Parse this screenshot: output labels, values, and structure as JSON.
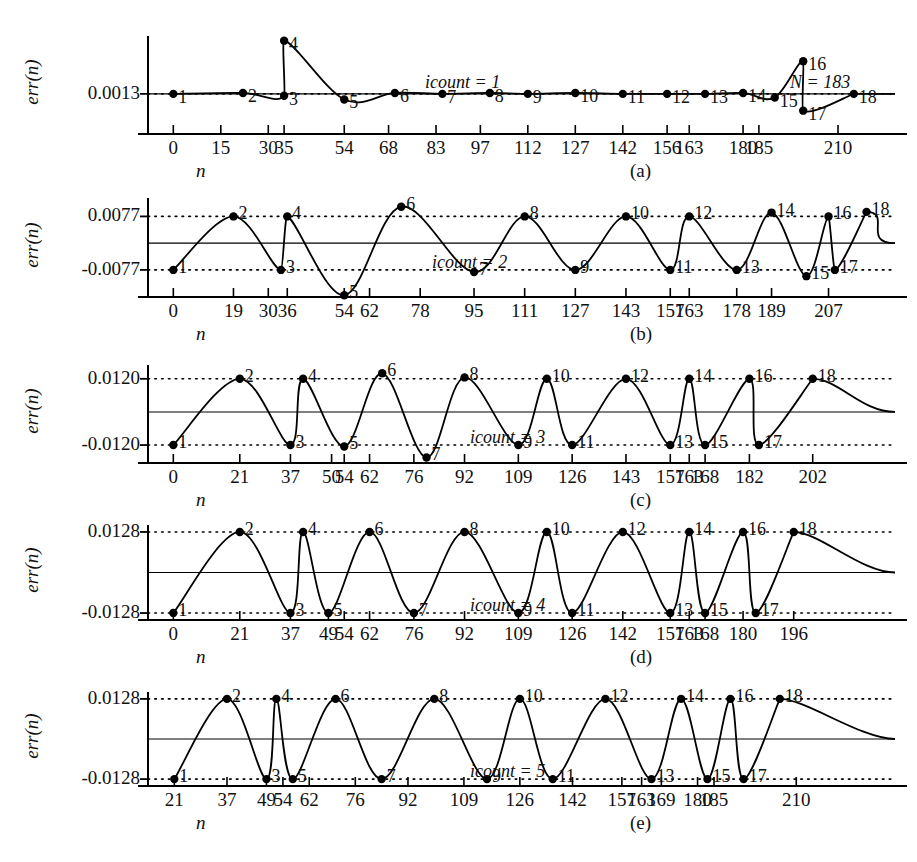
{
  "figure": {
    "ylabel": "err(n)",
    "xlabel": "n"
  },
  "chart_data": [
    {
      "type": "line",
      "panel": "(a)",
      "title": "",
      "xlabel": "n",
      "ylabel": "err(n)",
      "annotation": "icount = 1",
      "annotation2": "N = 183",
      "ytick_labels": [
        "0.0013"
      ],
      "ylim": [
        -0.003,
        0.0075
      ],
      "yticks": [
        0.0013
      ],
      "grid": "dotted at 0.0013",
      "xlim": [
        -8,
        228
      ],
      "xtick_labels": [
        "0",
        "15",
        "30",
        "35",
        "54",
        "68",
        "83",
        "97",
        "112",
        "127",
        "142",
        "156",
        "163",
        "180",
        "185",
        "210"
      ],
      "xticks": [
        0,
        15,
        30,
        35,
        54,
        68,
        83,
        97,
        112,
        127,
        142,
        156,
        163,
        180,
        185,
        210
      ],
      "points": [
        {
          "label": "1",
          "x": 0,
          "y": 0.0013
        },
        {
          "label": "2",
          "x": 22,
          "y": 0.0014
        },
        {
          "label": "3",
          "x": 35,
          "y": 0.0011
        },
        {
          "label": "4",
          "x": 35,
          "y": 0.007
        },
        {
          "label": "5",
          "x": 54,
          "y": 0.0007
        },
        {
          "label": "6",
          "x": 70,
          "y": 0.0014
        },
        {
          "label": "7",
          "x": 85,
          "y": 0.0013
        },
        {
          "label": "8",
          "x": 100,
          "y": 0.0014
        },
        {
          "label": "9",
          "x": 112,
          "y": 0.0013
        },
        {
          "label": "10",
          "x": 127,
          "y": 0.0014
        },
        {
          "label": "11",
          "x": 142,
          "y": 0.0013
        },
        {
          "label": "12",
          "x": 156,
          "y": 0.0013
        },
        {
          "label": "13",
          "x": 168,
          "y": 0.0013
        },
        {
          "label": "14",
          "x": 180,
          "y": 0.0014
        },
        {
          "label": "15",
          "x": 190,
          "y": 0.0009
        },
        {
          "label": "16",
          "x": 199,
          "y": 0.0048
        },
        {
          "label": "17",
          "x": 199,
          "y": -0.0005
        },
        {
          "label": "18",
          "x": 215,
          "y": 0.0013
        }
      ]
    },
    {
      "type": "line",
      "panel": "(b)",
      "title": "",
      "xlabel": "n",
      "ylabel": "err(n)",
      "annotation": "icount = 2",
      "ytick_labels": [
        "0.0077",
        "-0.0077"
      ],
      "yticks": [
        0.0077,
        -0.0077
      ],
      "ylim": [
        -0.0155,
        0.013
      ],
      "grid": "dotted at +/-0.0077",
      "xlim": [
        -8,
        228
      ],
      "xtick_labels": [
        "0",
        "19",
        "30",
        "36",
        "54",
        "62",
        "78",
        "95",
        "111",
        "127",
        "143",
        "157",
        "163",
        "178",
        "189",
        "207"
      ],
      "xticks": [
        0,
        19,
        30,
        36,
        54,
        62,
        78,
        95,
        111,
        127,
        143,
        157,
        163,
        178,
        189,
        207
      ],
      "points": [
        {
          "label": "1",
          "x": 0,
          "y": -0.0077
        },
        {
          "label": "2",
          "x": 19,
          "y": 0.0077
        },
        {
          "label": "3",
          "x": 34,
          "y": -0.0077
        },
        {
          "label": "4",
          "x": 36,
          "y": 0.0077
        },
        {
          "label": "5",
          "x": 54,
          "y": -0.015
        },
        {
          "label": "6",
          "x": 72,
          "y": 0.0105
        },
        {
          "label": "7",
          "x": 95,
          "y": -0.0083
        },
        {
          "label": "8",
          "x": 111,
          "y": 0.0077
        },
        {
          "label": "9",
          "x": 127,
          "y": -0.0077
        },
        {
          "label": "10",
          "x": 143,
          "y": 0.0077
        },
        {
          "label": "11",
          "x": 157,
          "y": -0.0077
        },
        {
          "label": "12",
          "x": 163,
          "y": 0.0077
        },
        {
          "label": "13",
          "x": 178,
          "y": -0.0077
        },
        {
          "label": "14",
          "x": 189,
          "y": 0.0088
        },
        {
          "label": "15",
          "x": 200,
          "y": -0.0095
        },
        {
          "label": "16",
          "x": 207,
          "y": 0.0077
        },
        {
          "label": "17",
          "x": 209,
          "y": -0.0077
        },
        {
          "label": "18",
          "x": 219,
          "y": 0.009
        }
      ]
    },
    {
      "type": "line",
      "panel": "(c)",
      "title": "",
      "xlabel": "n",
      "ylabel": "err(n)",
      "annotation": "icount = 3",
      "ytick_labels": [
        "0.0120",
        "-0.0120"
      ],
      "yticks": [
        0.012,
        -0.012
      ],
      "ylim": [
        -0.0185,
        0.017
      ],
      "grid": "dotted at +/-0.0120",
      "xlim": [
        -8,
        228
      ],
      "xtick_labels": [
        "0",
        "21",
        "37",
        "50",
        "54",
        "62",
        "76",
        "92",
        "109",
        "126",
        "143",
        "157",
        "163",
        "168",
        "182",
        "202"
      ],
      "xticks": [
        0,
        21,
        37,
        50,
        54,
        62,
        76,
        92,
        109,
        126,
        143,
        157,
        163,
        168,
        182,
        202
      ],
      "points": [
        {
          "label": "1",
          "x": 0,
          "y": -0.012
        },
        {
          "label": "2",
          "x": 21,
          "y": 0.012
        },
        {
          "label": "3",
          "x": 37,
          "y": -0.012
        },
        {
          "label": "4",
          "x": 41,
          "y": 0.012
        },
        {
          "label": "5",
          "x": 54,
          "y": -0.0125
        },
        {
          "label": "6",
          "x": 66,
          "y": 0.014
        },
        {
          "label": "7",
          "x": 80,
          "y": -0.0165
        },
        {
          "label": "8",
          "x": 92,
          "y": 0.0125
        },
        {
          "label": "9",
          "x": 109,
          "y": -0.012
        },
        {
          "label": "10",
          "x": 118,
          "y": 0.012
        },
        {
          "label": "11",
          "x": 126,
          "y": -0.012
        },
        {
          "label": "12",
          "x": 143,
          "y": 0.012
        },
        {
          "label": "13",
          "x": 157,
          "y": -0.012
        },
        {
          "label": "14",
          "x": 163,
          "y": 0.012
        },
        {
          "label": "15",
          "x": 168,
          "y": -0.012
        },
        {
          "label": "16",
          "x": 182,
          "y": 0.012
        },
        {
          "label": "17",
          "x": 185,
          "y": -0.012
        },
        {
          "label": "18",
          "x": 202,
          "y": 0.012
        }
      ]
    },
    {
      "type": "line",
      "panel": "(d)",
      "title": "",
      "xlabel": "n",
      "ylabel": "err(n)",
      "annotation": "icount = 4",
      "ytick_labels": [
        "0.0128",
        "-0.0128"
      ],
      "yticks": [
        0.0128,
        -0.0128
      ],
      "ylim": [
        -0.015,
        0.015
      ],
      "grid": "dotted at +/-0.0128",
      "xlim": [
        -8,
        228
      ],
      "xtick_labels": [
        "0",
        "21",
        "37",
        "49",
        "54",
        "62",
        "76",
        "92",
        "109",
        "126",
        "142",
        "157",
        "163",
        "168",
        "180",
        "196"
      ],
      "xticks": [
        0,
        21,
        37,
        49,
        54,
        62,
        76,
        92,
        109,
        126,
        142,
        157,
        163,
        168,
        180,
        196
      ],
      "points": [
        {
          "label": "1",
          "x": 0,
          "y": -0.0128
        },
        {
          "label": "2",
          "x": 21,
          "y": 0.0128
        },
        {
          "label": "3",
          "x": 37,
          "y": -0.0128
        },
        {
          "label": "4",
          "x": 41,
          "y": 0.0128
        },
        {
          "label": "5",
          "x": 49,
          "y": -0.0128
        },
        {
          "label": "6",
          "x": 62,
          "y": 0.0128
        },
        {
          "label": "7",
          "x": 76,
          "y": -0.0128
        },
        {
          "label": "8",
          "x": 92,
          "y": 0.0128
        },
        {
          "label": "9",
          "x": 109,
          "y": -0.0128
        },
        {
          "label": "10",
          "x": 118,
          "y": 0.0128
        },
        {
          "label": "11",
          "x": 126,
          "y": -0.0128
        },
        {
          "label": "12",
          "x": 142,
          "y": 0.0128
        },
        {
          "label": "13",
          "x": 157,
          "y": -0.0128
        },
        {
          "label": "14",
          "x": 163,
          "y": 0.0128
        },
        {
          "label": "15",
          "x": 168,
          "y": -0.0128
        },
        {
          "label": "16",
          "x": 180,
          "y": 0.0128
        },
        {
          "label": "17",
          "x": 184,
          "y": -0.0128
        },
        {
          "label": "18",
          "x": 196,
          "y": 0.0128
        }
      ]
    },
    {
      "type": "line",
      "panel": "(e)",
      "title": "",
      "xlabel": "n",
      "ylabel": "err(n)",
      "annotation": "icount = 5",
      "ytick_labels": [
        "0.0128",
        "-0.0128"
      ],
      "yticks": [
        0.0128,
        -0.0128
      ],
      "ylim": [
        -0.015,
        0.015
      ],
      "grid": "dotted at +/-0.0128",
      "xlim": [
        13,
        240
      ],
      "xtick_labels": [
        "21",
        "37",
        "49",
        "54",
        "62",
        "76",
        "92",
        "109",
        "126",
        "142",
        "157",
        "163",
        "169",
        "180",
        "185",
        "210"
      ],
      "xticks": [
        21,
        37,
        49,
        54,
        62,
        76,
        92,
        109,
        126,
        142,
        157,
        163,
        169,
        180,
        185,
        210
      ],
      "points": [
        {
          "label": "1",
          "x": 21,
          "y": -0.0128
        },
        {
          "label": "2",
          "x": 37,
          "y": 0.0128
        },
        {
          "label": "3",
          "x": 49,
          "y": -0.0128
        },
        {
          "label": "4",
          "x": 52,
          "y": 0.0128
        },
        {
          "label": "5",
          "x": 57,
          "y": -0.0128
        },
        {
          "label": "6",
          "x": 70,
          "y": 0.0128
        },
        {
          "label": "7",
          "x": 84,
          "y": -0.0128
        },
        {
          "label": "8",
          "x": 100,
          "y": 0.0128
        },
        {
          "label": "9",
          "x": 116,
          "y": -0.0128
        },
        {
          "label": "10",
          "x": 126,
          "y": 0.0128
        },
        {
          "label": "11",
          "x": 136,
          "y": -0.0128
        },
        {
          "label": "12",
          "x": 152,
          "y": 0.0128
        },
        {
          "label": "13",
          "x": 166,
          "y": -0.0128
        },
        {
          "label": "14",
          "x": 175,
          "y": 0.0128
        },
        {
          "label": "15",
          "x": 183,
          "y": -0.0128
        },
        {
          "label": "16",
          "x": 190,
          "y": 0.0128
        },
        {
          "label": "17",
          "x": 194,
          "y": -0.0128
        },
        {
          "label": "18",
          "x": 205,
          "y": 0.0128
        }
      ]
    }
  ]
}
